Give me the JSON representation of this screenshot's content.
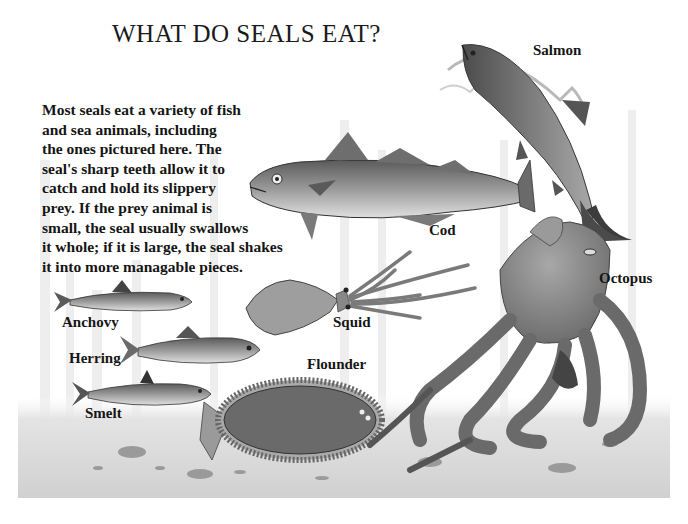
{
  "title": "WHAT DO SEALS EAT?",
  "description": "Most seals eat a variety of fish\nand sea animals, including\nthe ones pictured here. The\nseal's sharp teeth allow it to\ncatch and hold its slippery\nprey. If the prey animal is\nsmall, the seal usually swallows\nit whole; if it is large, the seal shakes\nit into more managable pieces.",
  "animals": [
    {
      "name": "Salmon",
      "label": "Salmon"
    },
    {
      "name": "Cod",
      "label": "Cod"
    },
    {
      "name": "Octopus",
      "label": "Octopus"
    },
    {
      "name": "Squid",
      "label": "Squid"
    },
    {
      "name": "Anchovy",
      "label": "Anchovy"
    },
    {
      "name": "Herring",
      "label": "Herring"
    },
    {
      "name": "Smelt",
      "label": "Smelt"
    },
    {
      "name": "Flounder",
      "label": "Flounder"
    }
  ],
  "colors": {
    "background": "#ffffff",
    "ink": "#151515",
    "pencil_dark": "#4a4a4a",
    "pencil_mid": "#8a8a8a",
    "pencil_light": "#c8c8c8",
    "seabed": "#dcdcdc"
  }
}
